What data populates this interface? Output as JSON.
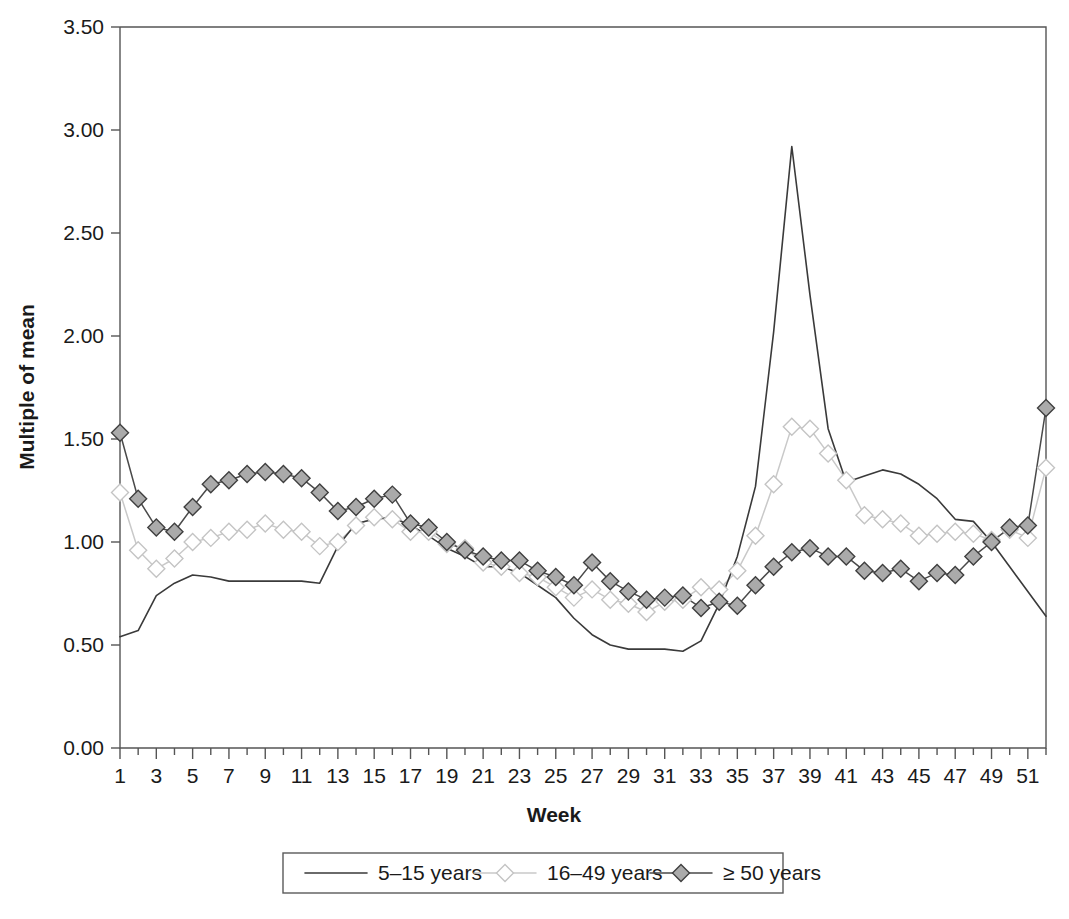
{
  "chart_data": {
    "type": "line",
    "title": "",
    "subtitle": "",
    "xlabel": "Week",
    "ylabel": "Multiple of mean",
    "xlim": [
      1,
      52
    ],
    "ylim": [
      0.0,
      3.5
    ],
    "grid": false,
    "legend_position": "bottom",
    "ytick_labels": [
      "0.00",
      "0.50",
      "1.00",
      "1.50",
      "2.00",
      "2.50",
      "3.00",
      "3.50"
    ],
    "ytick_values": [
      0.0,
      0.5,
      1.0,
      1.5,
      2.0,
      2.5,
      3.0,
      3.5
    ],
    "xtick_labels": [
      "1",
      "3",
      "5",
      "7",
      "9",
      "11",
      "13",
      "15",
      "17",
      "19",
      "21",
      "23",
      "25",
      "27",
      "29",
      "31",
      "33",
      "35",
      "37",
      "39",
      "41",
      "43",
      "45",
      "47",
      "49",
      "51"
    ],
    "xtick_values": [
      1,
      3,
      5,
      7,
      9,
      11,
      13,
      15,
      17,
      19,
      21,
      23,
      25,
      27,
      29,
      31,
      33,
      35,
      37,
      39,
      41,
      43,
      45,
      47,
      49,
      51
    ],
    "x": [
      1,
      2,
      3,
      4,
      5,
      6,
      7,
      8,
      9,
      10,
      11,
      12,
      13,
      14,
      15,
      16,
      17,
      18,
      19,
      20,
      21,
      22,
      23,
      24,
      25,
      26,
      27,
      28,
      29,
      30,
      31,
      32,
      33,
      34,
      35,
      36,
      37,
      38,
      39,
      40,
      41,
      42,
      43,
      44,
      45,
      46,
      47,
      48,
      49,
      50,
      51,
      52
    ],
    "series": [
      {
        "name": "5–15 years",
        "marker": "none",
        "color": "#3a3a3a",
        "values": [
          0.54,
          0.57,
          0.74,
          0.8,
          0.84,
          0.83,
          0.81,
          0.81,
          0.81,
          0.81,
          0.81,
          0.8,
          0.98,
          1.09,
          1.11,
          1.12,
          1.08,
          1.03,
          0.97,
          0.93,
          0.88,
          0.88,
          0.85,
          0.79,
          0.73,
          0.63,
          0.55,
          0.5,
          0.48,
          0.48,
          0.48,
          0.47,
          0.52,
          0.7,
          0.93,
          1.27,
          2.02,
          2.92,
          2.2,
          1.55,
          1.29,
          1.32,
          1.35,
          1.33,
          1.28,
          1.21,
          1.11,
          1.1,
          1.0,
          0.88,
          0.76,
          0.64
        ]
      },
      {
        "name": "16–49 years",
        "marker": "diamond-open",
        "color": "#c9c9c9",
        "values": [
          1.24,
          0.96,
          0.87,
          0.92,
          1.0,
          1.02,
          1.05,
          1.06,
          1.09,
          1.06,
          1.05,
          0.98,
          1.0,
          1.08,
          1.12,
          1.11,
          1.05,
          1.05,
          0.99,
          0.97,
          0.9,
          0.88,
          0.85,
          0.83,
          0.78,
          0.73,
          0.77,
          0.72,
          0.7,
          0.66,
          0.71,
          0.72,
          0.78,
          0.77,
          0.86,
          1.03,
          1.28,
          1.56,
          1.55,
          1.43,
          1.3,
          1.13,
          1.11,
          1.09,
          1.03,
          1.04,
          1.05,
          1.04,
          1.01,
          1.06,
          1.02,
          1.36
        ]
      },
      {
        "name": "≥ 50 years",
        "marker": "diamond-filled",
        "color": "#3f3f3f",
        "values": [
          1.53,
          1.21,
          1.07,
          1.05,
          1.17,
          1.28,
          1.3,
          1.33,
          1.34,
          1.33,
          1.31,
          1.24,
          1.15,
          1.17,
          1.21,
          1.23,
          1.09,
          1.07,
          1.0,
          0.96,
          0.93,
          0.91,
          0.91,
          0.86,
          0.83,
          0.79,
          0.9,
          0.81,
          0.76,
          0.72,
          0.73,
          0.74,
          0.68,
          0.71,
          0.69,
          0.79,
          0.88,
          0.95,
          0.97,
          0.93,
          0.93,
          0.86,
          0.85,
          0.87,
          0.81,
          0.85,
          0.84,
          0.93,
          1.0,
          1.07,
          1.08,
          1.65
        ]
      }
    ]
  },
  "legend": {
    "entries": [
      {
        "label": "5–15 years",
        "marker": "none"
      },
      {
        "label": "16–49 years",
        "marker": "diamond-open"
      },
      {
        "label": "≥ 50 years",
        "marker": "diamond-filled"
      }
    ]
  },
  "colors": {
    "axis": "#555555",
    "text": "#1a1a1a",
    "series_dark": "#3a3a3a",
    "series_light": "#c9c9c9",
    "marker_fill_dark": "#aaaaaa",
    "marker_fill_light": "#ffffff"
  }
}
